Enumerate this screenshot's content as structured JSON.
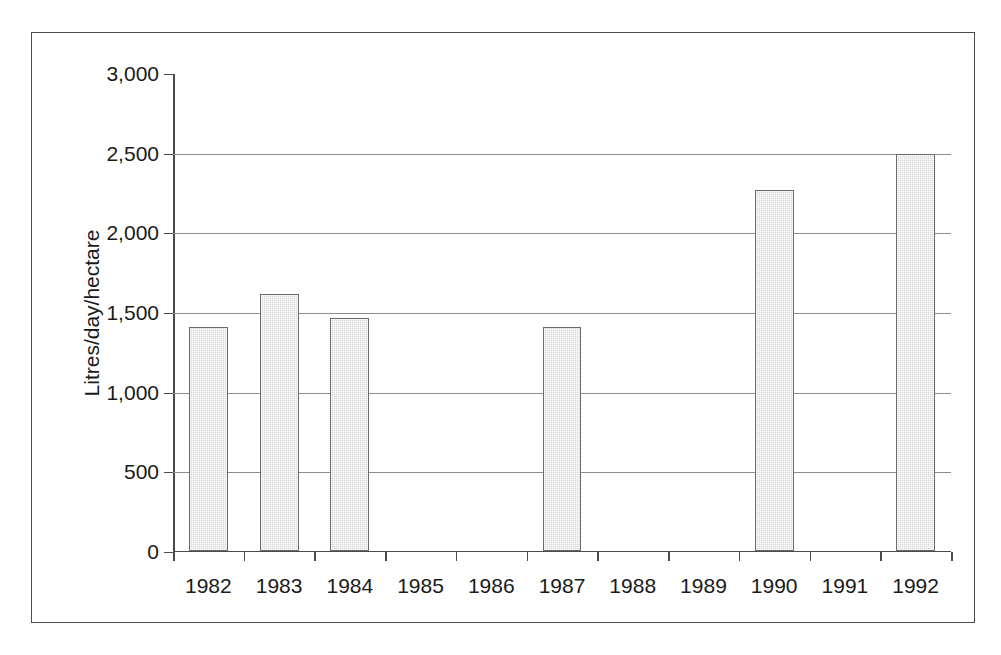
{
  "chart_data": {
    "type": "bar",
    "title": "",
    "xlabel": "",
    "ylabel": "Litres/day/hectare",
    "categories": [
      "1982",
      "1983",
      "1984",
      "1985",
      "1986",
      "1987",
      "1988",
      "1989",
      "1990",
      "1991",
      "1992"
    ],
    "values": [
      1400,
      1610,
      1460,
      0,
      0,
      1400,
      0,
      0,
      2260,
      0,
      2490
    ],
    "ylim": [
      0,
      3000
    ],
    "ytick_values": [
      0,
      500,
      1000,
      1500,
      2000,
      2500,
      3000
    ],
    "ytick_labels": [
      "0",
      "500",
      "1,000",
      "1,500",
      "2,000",
      "2,500",
      "3,000"
    ],
    "gridline_values": [
      500,
      1000,
      1500,
      2000,
      2500
    ],
    "grid": true,
    "legend": "none",
    "series": [
      {
        "name": "Litres/day/hectare",
        "values": [
          1400,
          1610,
          1460,
          0,
          0,
          1400,
          0,
          0,
          2260,
          0,
          2490
        ]
      }
    ],
    "colors": {
      "bar_fill": "#d9d9d9",
      "bar_border": "#6b6b6b",
      "axis": "#4a4a4a",
      "gridline": "#8c8c8c",
      "text": "#1a1a1a",
      "background": "#ffffff",
      "frame_border": "#4a4a4a"
    }
  }
}
